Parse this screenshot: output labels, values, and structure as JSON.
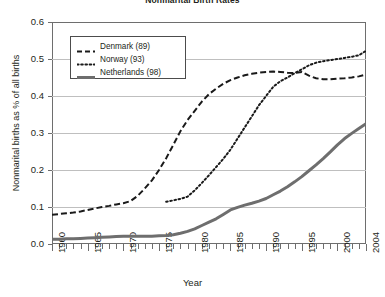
{
  "chart_data": {
    "type": "line",
    "title": "Nonmarital Birth Rates",
    "xlabel": "Year",
    "ylabel": "Nonmarital births as % of all births",
    "xlim": [
      1960,
      2004
    ],
    "ylim": [
      0.0,
      0.6
    ],
    "xticks": [
      1960,
      1965,
      1970,
      1975,
      1980,
      1985,
      1990,
      1995,
      2000,
      2004
    ],
    "xtick_labels": [
      "1960",
      "1965",
      "1970",
      "1975",
      "1980",
      "1985",
      "1990",
      "1995",
      "2000",
      "2004"
    ],
    "xtick_minor_interval": 1,
    "yticks": [
      0.0,
      0.1,
      0.2,
      0.3,
      0.4,
      0.5,
      0.6
    ],
    "ytick_labels": [
      "0.0",
      "0.1",
      "0.2",
      "0.3",
      "0.4",
      "0.5",
      "0.6"
    ],
    "grid": "horizontal",
    "legend_position": "upper-left-inside",
    "series": [
      {
        "name": "Denmark (89)",
        "style": "dashed",
        "color": "#1a1a1a",
        "x": [
          1960,
          1961,
          1962,
          1963,
          1964,
          1965,
          1966,
          1967,
          1968,
          1969,
          1970,
          1971,
          1972,
          1973,
          1974,
          1975,
          1976,
          1977,
          1978,
          1979,
          1980,
          1981,
          1982,
          1983,
          1984,
          1985,
          1986,
          1987,
          1988,
          1989,
          1990,
          1991,
          1992,
          1993,
          1994,
          1995,
          1996,
          1997,
          1998,
          1999,
          2000,
          2001,
          2002,
          2003,
          2004
        ],
        "y": [
          0.079,
          0.081,
          0.083,
          0.085,
          0.088,
          0.092,
          0.096,
          0.1,
          0.103,
          0.107,
          0.11,
          0.116,
          0.13,
          0.15,
          0.172,
          0.2,
          0.232,
          0.268,
          0.305,
          0.335,
          0.36,
          0.385,
          0.405,
          0.42,
          0.433,
          0.443,
          0.45,
          0.456,
          0.46,
          0.463,
          0.465,
          0.466,
          0.465,
          0.463,
          0.462,
          0.465,
          0.455,
          0.448,
          0.445,
          0.445,
          0.447,
          0.448,
          0.45,
          0.453,
          0.458
        ]
      },
      {
        "name": "Norway (93)",
        "style": "dotted",
        "color": "#1a1a1a",
        "x": [
          1976,
          1977,
          1978,
          1979,
          1980,
          1981,
          1982,
          1983,
          1984,
          1985,
          1986,
          1987,
          1988,
          1989,
          1990,
          1991,
          1992,
          1993,
          1994,
          1995,
          1996,
          1997,
          1998,
          1999,
          2000,
          2001,
          2002,
          2003,
          2004
        ],
        "y": [
          0.114,
          0.118,
          0.122,
          0.128,
          0.145,
          0.165,
          0.186,
          0.208,
          0.23,
          0.255,
          0.285,
          0.315,
          0.345,
          0.375,
          0.4,
          0.425,
          0.44,
          0.45,
          0.462,
          0.472,
          0.483,
          0.49,
          0.494,
          0.497,
          0.5,
          0.503,
          0.506,
          0.51,
          0.522
        ]
      },
      {
        "name": "Netherlands (98)",
        "style": "solid",
        "color": "#6e6e6e",
        "x": [
          1960,
          1961,
          1962,
          1963,
          1964,
          1965,
          1966,
          1967,
          1968,
          1969,
          1970,
          1971,
          1972,
          1973,
          1974,
          1975,
          1976,
          1977,
          1978,
          1979,
          1980,
          1981,
          1982,
          1983,
          1984,
          1985,
          1986,
          1987,
          1988,
          1989,
          1990,
          1991,
          1992,
          1993,
          1994,
          1995,
          1996,
          1997,
          1998,
          1999,
          2000,
          2001,
          2002,
          2003,
          2004
        ],
        "y": [
          0.013,
          0.013,
          0.014,
          0.014,
          0.015,
          0.016,
          0.017,
          0.018,
          0.019,
          0.02,
          0.021,
          0.021,
          0.021,
          0.021,
          0.021,
          0.022,
          0.023,
          0.025,
          0.029,
          0.034,
          0.041,
          0.05,
          0.059,
          0.068,
          0.08,
          0.092,
          0.099,
          0.105,
          0.11,
          0.116,
          0.123,
          0.133,
          0.143,
          0.155,
          0.168,
          0.182,
          0.198,
          0.214,
          0.231,
          0.249,
          0.268,
          0.285,
          0.299,
          0.312,
          0.325
        ]
      }
    ]
  },
  "legend": {
    "items": [
      {
        "label": "Denmark (89)",
        "style": "dashed"
      },
      {
        "label": "Norway (93)",
        "style": "dotted"
      },
      {
        "label": "Netherlands (98)",
        "style": "solid"
      }
    ]
  }
}
